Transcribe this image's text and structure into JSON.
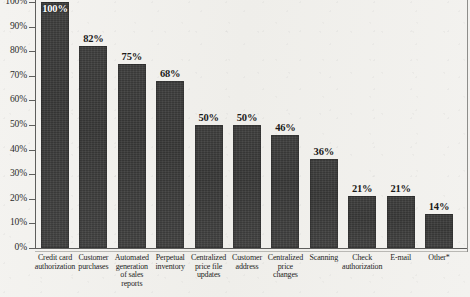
{
  "chart_data": {
    "type": "bar",
    "title": "",
    "subtitle": "",
    "xlabel": "",
    "ylabel": "",
    "ylim": [
      0,
      100
    ],
    "grid": false,
    "legend": "none",
    "value_suffix": "%",
    "categories": [
      "Credit card authorization",
      "Customer purchases",
      "Automated generation of sales reports",
      "Perpetual inventory",
      "Centralized price file updates",
      "Customer address",
      "Centralized price changes",
      "Scanning",
      "Check authorization",
      "E-mail",
      "Other*"
    ],
    "category_lines": [
      [
        "Credit card",
        "authorization"
      ],
      [
        "Customer",
        "purchases"
      ],
      [
        "Automated",
        "generation",
        "of sales",
        "reports"
      ],
      [
        "Perpetual",
        "inventory"
      ],
      [
        "Centralized",
        "price file",
        "updates"
      ],
      [
        "Customer",
        "address"
      ],
      [
        "Centralized",
        "price",
        "changes"
      ],
      [
        "Scanning"
      ],
      [
        "Check",
        "authorization"
      ],
      [
        "E-mail"
      ],
      [
        "Other*"
      ]
    ],
    "values": [
      100,
      82,
      75,
      68,
      50,
      50,
      46,
      36,
      21,
      21,
      14
    ],
    "data_labels": [
      "100%",
      "82%",
      "75%",
      "68%",
      "50%",
      "50%",
      "46%",
      "36%",
      "21%",
      "21%",
      "14%"
    ],
    "ytick_labels": [
      "0%",
      "10%",
      "20%",
      "30%",
      "40%",
      "50%",
      "60%",
      "70%",
      "80%",
      "90%",
      "100%"
    ],
    "ytick_values": [
      0,
      10,
      20,
      30,
      40,
      50,
      60,
      70,
      80,
      90,
      100
    ],
    "bar_color": "#3b3b3a",
    "axis_color": "#5e5e5c",
    "text_color": "#262625",
    "background_color": "#f2f1ee"
  }
}
